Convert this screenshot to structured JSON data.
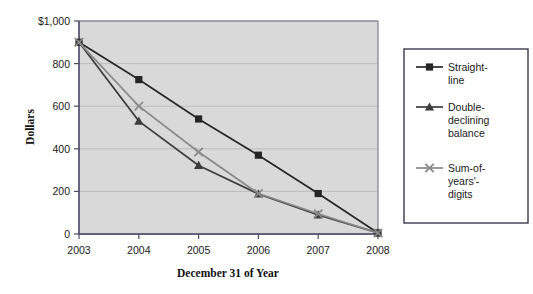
{
  "chart_data": {
    "type": "line",
    "title": "",
    "xlabel": "December 31 of Year",
    "ylabel": "Dollars",
    "categories": [
      "2003",
      "2004",
      "2005",
      "2006",
      "2007",
      "2008"
    ],
    "x": [
      2003,
      2004,
      2005,
      2006,
      2007,
      2008
    ],
    "ylim": [
      0,
      1000
    ],
    "xlim": [
      2003,
      2008
    ],
    "yticks": [
      0,
      200,
      400,
      600,
      800,
      1000
    ],
    "ytick_labels": [
      "0",
      "200",
      "400",
      "600",
      "800",
      "$1,000"
    ],
    "grid": true,
    "legend_position": "right-outside",
    "series": [
      {
        "name": "Straight-line",
        "marker": "square",
        "color": "#262626",
        "values": [
          900,
          725,
          540,
          370,
          190,
          5
        ]
      },
      {
        "name": "Double-declining balance",
        "marker": "triangle",
        "color": "#3d3d3d",
        "values": [
          900,
          530,
          322,
          188,
          90,
          5
        ]
      },
      {
        "name": "Sum-of-years'-digits",
        "marker": "cross",
        "color": "#8a8a8a",
        "values": [
          900,
          600,
          385,
          190,
          95,
          5
        ]
      }
    ]
  },
  "axis": {
    "y_label": "Dollars",
    "x_label": "December 31 of Year",
    "y_ticks": [
      "$1,000",
      "800",
      "600",
      "400",
      "200",
      "0"
    ],
    "x_ticks": [
      "2003",
      "2004",
      "2005",
      "2006",
      "2007",
      "2008"
    ]
  },
  "legend": {
    "items": [
      {
        "label_line1": "Straight-",
        "label_line2": "line",
        "label_line3": "",
        "marker": "square-marker-icon"
      },
      {
        "label_line1": "Double-",
        "label_line2": "declining",
        "label_line3": "balance",
        "marker": "triangle-marker-icon"
      },
      {
        "label_line1": "Sum-of-",
        "label_line2": "years'-",
        "label_line3": "digits",
        "marker": "cross-marker-icon"
      }
    ]
  }
}
